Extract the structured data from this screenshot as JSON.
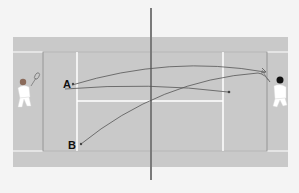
{
  "diagram": {
    "type": "tennis-court-shot-diagram",
    "colors": {
      "background": "#f4f4f4",
      "court": "#c9c9c9",
      "lines": "#ffffff",
      "net": "#777777",
      "trajectory": "#555555",
      "label": "#111111"
    },
    "positions": [
      {
        "id": "A",
        "label": "A"
      },
      {
        "id": "B",
        "label": "B"
      }
    ],
    "players": [
      {
        "id": "left-player",
        "side": "left"
      },
      {
        "id": "right-player",
        "side": "right"
      }
    ],
    "trajectories": [
      {
        "from": "A",
        "to": "right-player",
        "description": "ball hit from A toward right player"
      },
      {
        "from": "left-player",
        "to": "right-baseline-deep",
        "description": "shot from left side to right court"
      },
      {
        "from": "B",
        "to": "right-player",
        "description": "ball hit from B toward right player"
      }
    ]
  }
}
